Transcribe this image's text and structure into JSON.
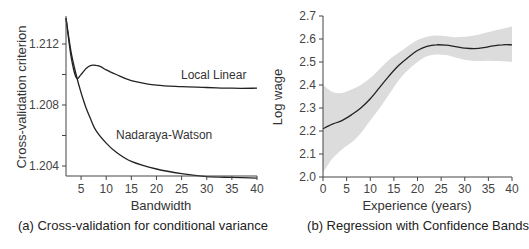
{
  "chart_data": [
    {
      "type": "line",
      "panel_caption": "(a) Cross-validation for conditional variance",
      "xlabel": "Bandwidth",
      "ylabel": "Cross-validation criterion",
      "xlim": [
        2,
        40
      ],
      "ylim": [
        1.2032,
        1.2138
      ],
      "x_ticks": [
        5,
        10,
        15,
        20,
        25,
        30,
        35,
        40
      ],
      "y_ticks": [
        1.204,
        1.206,
        1.208,
        1.21,
        1.212
      ],
      "y_tick_labels": [
        "1.204",
        "",
        "1.208",
        "",
        "1.212"
      ],
      "grid": false,
      "series": [
        {
          "name": "Local Linear",
          "x": [
            2,
            3,
            4,
            5,
            6,
            7,
            8,
            9,
            10,
            12,
            15,
            20,
            25,
            30,
            35,
            40
          ],
          "values": [
            1.2137,
            1.2112,
            1.2098,
            1.21,
            1.2104,
            1.2106,
            1.2106,
            1.2105,
            1.2103,
            1.21,
            1.2096,
            1.2093,
            1.2092,
            1.20915,
            1.2091,
            1.2091
          ]
        },
        {
          "name": "Nadaraya-Watson",
          "x": [
            2,
            3,
            4,
            5,
            6,
            7,
            8,
            10,
            12,
            15,
            20,
            25,
            30,
            35,
            40
          ],
          "values": [
            1.2137,
            1.2115,
            1.21,
            1.2088,
            1.2078,
            1.207,
            1.2063,
            1.2055,
            1.2049,
            1.2043,
            1.2038,
            1.2035,
            1.2033,
            1.20325,
            1.2032
          ]
        }
      ],
      "annotations": [
        "Local Linear",
        "Nadaraya-Watson"
      ]
    },
    {
      "type": "line",
      "panel_caption": "(b) Regression with Confidence Bands",
      "xlabel": "Experience (years)",
      "ylabel": "Log wage",
      "xlim": [
        0,
        40
      ],
      "ylim": [
        2.0,
        2.7
      ],
      "x_ticks": [
        0,
        5,
        10,
        15,
        20,
        25,
        30,
        35,
        40
      ],
      "y_ticks": [
        2.0,
        2.1,
        2.2,
        2.3,
        2.4,
        2.5,
        2.6,
        2.7
      ],
      "y_tick_labels": [
        "2.0",
        "2.1",
        "2.2",
        "2.3",
        "2.4",
        "2.5",
        "2.6",
        "2.7"
      ],
      "grid": false,
      "series": [
        {
          "name": "Fitted log wage",
          "x": [
            0,
            2,
            4,
            6,
            8,
            10,
            12,
            14,
            16,
            18,
            20,
            22,
            24,
            26,
            28,
            30,
            32,
            34,
            36,
            38,
            40
          ],
          "values": [
            2.21,
            2.23,
            2.245,
            2.27,
            2.3,
            2.34,
            2.39,
            2.44,
            2.485,
            2.52,
            2.55,
            2.568,
            2.575,
            2.573,
            2.567,
            2.56,
            2.558,
            2.562,
            2.57,
            2.575,
            2.575
          ]
        },
        {
          "name": "Upper confidence band",
          "x": [
            0,
            2,
            4,
            6,
            8,
            10,
            12,
            14,
            16,
            18,
            20,
            22,
            24,
            26,
            28,
            30,
            32,
            34,
            36,
            38,
            40
          ],
          "values": [
            2.4,
            2.37,
            2.365,
            2.38,
            2.4,
            2.43,
            2.47,
            2.51,
            2.54,
            2.57,
            2.595,
            2.61,
            2.615,
            2.612,
            2.608,
            2.61,
            2.615,
            2.625,
            2.635,
            2.645,
            2.655
          ]
        },
        {
          "name": "Lower confidence band",
          "x": [
            0,
            2,
            4,
            6,
            8,
            10,
            12,
            14,
            16,
            18,
            20,
            22,
            24,
            26,
            28,
            30,
            32,
            34,
            36,
            38,
            40
          ],
          "values": [
            2.02,
            2.08,
            2.12,
            2.15,
            2.19,
            2.245,
            2.3,
            2.36,
            2.42,
            2.465,
            2.5,
            2.525,
            2.532,
            2.53,
            2.52,
            2.51,
            2.505,
            2.505,
            2.505,
            2.503,
            2.5
          ]
        }
      ],
      "band_color": "#dcdcdc",
      "line_color": "#222222"
    }
  ],
  "labels": {
    "a_caption": "(a) Cross-validation for conditional variance",
    "a_xlabel": "Bandwidth",
    "a_ylabel": "Cross-validation criterion",
    "a_annot_ll": "Local Linear",
    "a_annot_nw": "Nadaraya-Watson",
    "b_caption": "(b) Regression with Confidence Bands",
    "b_xlabel": "Experience (years)",
    "b_ylabel": "Log wage"
  }
}
